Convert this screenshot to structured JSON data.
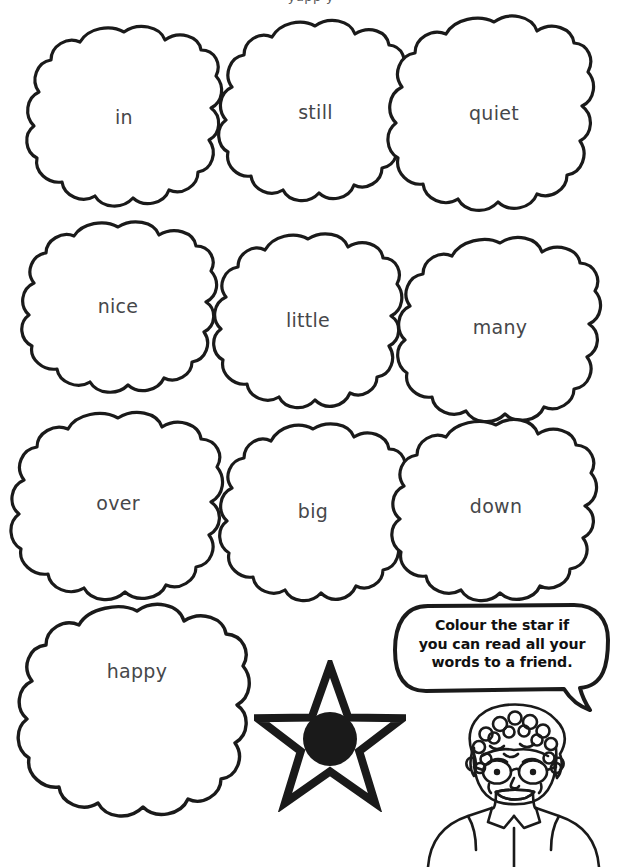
{
  "page": {
    "type": "worksheet",
    "title_clipped": "yapp y",
    "background_color": "#ffffff",
    "ink_color": "#1a1a1a",
    "text_color": "#46474a"
  },
  "word_clouds": [
    {
      "word": "in",
      "row": 1,
      "col": 1
    },
    {
      "word": "still",
      "row": 1,
      "col": 2
    },
    {
      "word": "quiet",
      "row": 1,
      "col": 3
    },
    {
      "word": "nice",
      "row": 2,
      "col": 1
    },
    {
      "word": "little",
      "row": 2,
      "col": 2
    },
    {
      "word": "many",
      "row": 2,
      "col": 3
    },
    {
      "word": "over",
      "row": 3,
      "col": 1
    },
    {
      "word": "big",
      "row": 3,
      "col": 2
    },
    {
      "word": "down",
      "row": 3,
      "col": 3
    },
    {
      "word": "happy",
      "row": 4,
      "col": 1
    }
  ],
  "speech_bubble": {
    "lines": [
      "Colour the star if",
      "you can read all your",
      "words to a friend."
    ],
    "full_text": "Colour the star if you can read all your words to a friend."
  },
  "star": {
    "points": 5,
    "outline_color": "#1a1a1a",
    "fill_color": "#ffffff",
    "center_dot_color": "#1a1a1a"
  },
  "character": {
    "description": "child with curly hair and glasses, smiling, wearing collared shirt"
  }
}
